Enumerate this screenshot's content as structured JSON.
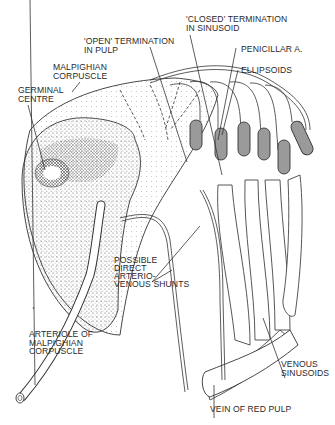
{
  "figure": {
    "labels": {
      "open_termination": [
        "'OPEN' TERMINATION",
        "IN PULP"
      ],
      "closed_termination": [
        "'CLOSED' TERMINATION",
        "IN SINUSOID"
      ],
      "malpighian_corpuscle": [
        "MALPIGHIAN",
        "CORPUSCLE"
      ],
      "penicillar": [
        "PENICILLAR A."
      ],
      "germinal_centre": [
        "GERMINAL",
        "CENTRE"
      ],
      "ellipsoids": [
        "ELLIPSOIDS"
      ],
      "shunts": [
        "POSSIBLE",
        "DIRECT",
        "ARTERIO-",
        "VENOUS SHUNTS"
      ],
      "arteriole": [
        "ARTERIOLE OF",
        "MALPIGHIAN",
        "CORPUSCLE"
      ],
      "venous_sinusoids": [
        "VENOUS",
        "SINUSOIDS"
      ],
      "vein": [
        "VEIN OF RED PULP"
      ]
    }
  }
}
